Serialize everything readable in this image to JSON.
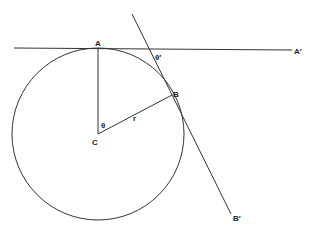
{
  "diagram": {
    "points": {
      "A": "A",
      "A_prime": "A′",
      "B": "B",
      "B_prime": "B′",
      "C": "C"
    },
    "labels": {
      "theta": "θ",
      "theta_prime": "θ′",
      "radius": "r"
    },
    "colors": {
      "line": "#333333",
      "text": "#222222",
      "background": "#ffffff"
    }
  }
}
